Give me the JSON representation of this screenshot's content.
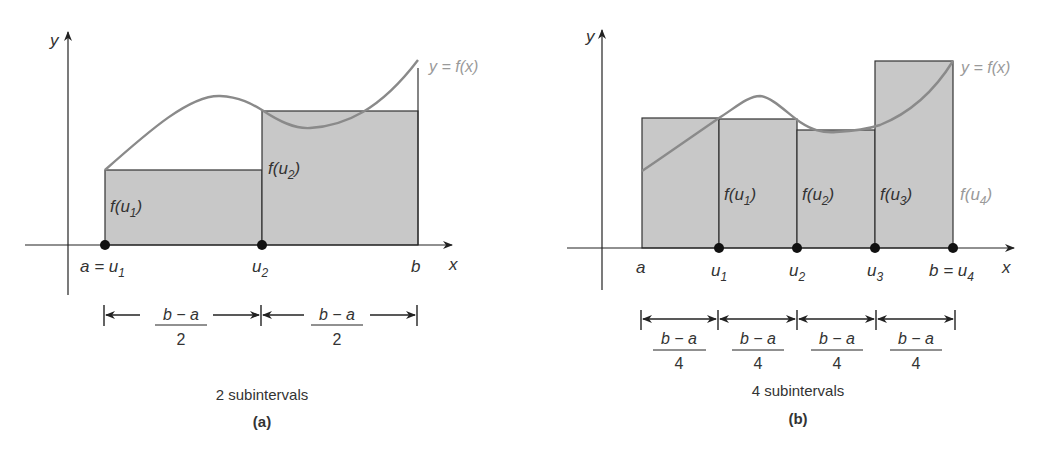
{
  "colors": {
    "fill": "#c8c8c8",
    "stroke": "#333333",
    "curve": "#8a8a8a",
    "curve_label": "#9a9a9a",
    "text": "#333333"
  },
  "panel_a": {
    "y_axis_label": "y",
    "x_axis_label": "x",
    "curve_label": "y = f(x)",
    "point_labels": [
      "a = u1",
      "u2",
      "b"
    ],
    "rect_labels": [
      "f(u1)",
      "f(u2)"
    ],
    "interval_label_numer": "b − a",
    "interval_label_denom": "2",
    "caption": "2 subintervals",
    "tag": "(a)"
  },
  "panel_b": {
    "y_axis_label": "y",
    "x_axis_label": "x",
    "curve_label": "y = f(x)",
    "point_labels": [
      "a",
      "u1",
      "u2",
      "u3",
      "b = u4"
    ],
    "rect_labels": [
      "f(u1)",
      "f(u2)",
      "f(u3)",
      "f(u4)"
    ],
    "interval_label_numer": "b − a",
    "interval_label_denom": "4",
    "caption": "4 subintervals",
    "tag": "(b)"
  }
}
